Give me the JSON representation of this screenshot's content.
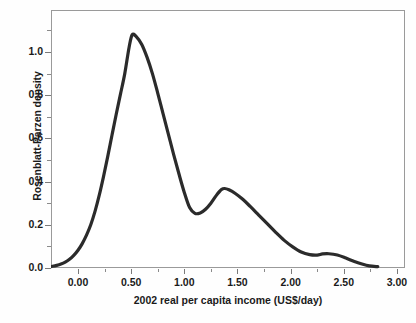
{
  "chart_data": {
    "type": "line",
    "title": "",
    "xlabel": "2002 real per capita  income (US$/day)",
    "ylabel": "Rosenblatt-Parzen density",
    "xlim": [
      -0.35,
      3.0
    ],
    "ylim": [
      0.0,
      1.17
    ],
    "grid": false,
    "legend": null,
    "xticks": [
      0.0,
      0.5,
      1.0,
      1.5,
      2.0,
      2.5,
      3.0
    ],
    "xtick_labels": [
      "0.00",
      "0.50",
      "1.00",
      "1.50",
      "2.00",
      "2.50",
      "3.00"
    ],
    "xminor_step": 0.25,
    "yticks": [
      0.0,
      0.2,
      0.4,
      0.6,
      0.8,
      1.0
    ],
    "ytick_labels": [
      "0.0",
      "0.2",
      "0.4",
      "0.6",
      "0.8",
      "1.0"
    ],
    "yminor_step": 0.1,
    "series": [
      {
        "name": "Rosenblatt-Parzen density estimate",
        "color": "#2b2b2b",
        "line_width": 3.2,
        "x": [
          -0.28,
          -0.24,
          -0.2,
          -0.16,
          -0.12,
          -0.08,
          -0.04,
          0.0,
          0.04,
          0.08,
          0.12,
          0.16,
          0.2,
          0.24,
          0.28,
          0.32,
          0.36,
          0.4,
          0.44,
          0.48,
          0.51,
          0.55,
          0.6,
          0.65,
          0.7,
          0.75,
          0.8,
          0.85,
          0.9,
          0.95,
          1.0,
          1.05,
          1.1,
          1.15,
          1.2,
          1.25,
          1.3,
          1.35,
          1.38,
          1.42,
          1.48,
          1.55,
          1.62,
          1.7,
          1.78,
          1.86,
          1.94,
          2.02,
          2.1,
          2.18,
          2.25,
          2.3,
          2.36,
          2.44,
          2.52,
          2.6,
          2.68,
          2.74,
          2.82
        ],
        "y": [
          0.005,
          0.008,
          0.012,
          0.018,
          0.027,
          0.04,
          0.058,
          0.082,
          0.113,
          0.152,
          0.2,
          0.262,
          0.337,
          0.423,
          0.517,
          0.616,
          0.713,
          0.806,
          0.9,
          1.02,
          1.08,
          1.07,
          1.035,
          0.975,
          0.9,
          0.81,
          0.715,
          0.62,
          0.525,
          0.435,
          0.35,
          0.28,
          0.253,
          0.255,
          0.272,
          0.3,
          0.335,
          0.363,
          0.368,
          0.362,
          0.345,
          0.318,
          0.285,
          0.245,
          0.205,
          0.165,
          0.128,
          0.098,
          0.074,
          0.062,
          0.06,
          0.065,
          0.066,
          0.06,
          0.046,
          0.03,
          0.017,
          0.01,
          0.006
        ]
      }
    ],
    "annotations": []
  },
  "axes": {
    "y_title": "Rosenblatt-Parzen density",
    "x_title": "2002 real per capita  income (US$/day)"
  }
}
